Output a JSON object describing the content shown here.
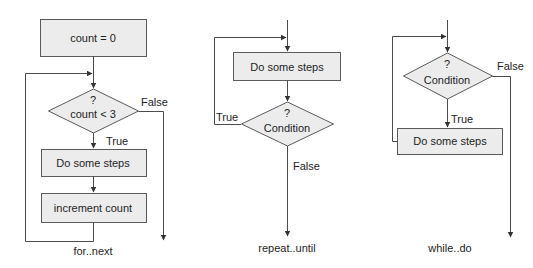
{
  "diagram": {
    "colors": {
      "shape_fill": "#ececec",
      "shape_stroke": "#5a5a5a",
      "line": "#4a4a4a",
      "text": "#1e1e1e"
    },
    "for_next": {
      "caption": "for..next",
      "init_box": "count = 0",
      "decision_mark": "?",
      "decision_text": "count < 3",
      "true_label": "True",
      "false_label": "False",
      "body_box": "Do some steps",
      "increment_box": "increment count"
    },
    "repeat_until": {
      "caption": "repeat..until",
      "body_box": "Do some steps",
      "decision_mark": "?",
      "decision_text": "Condition",
      "true_label": "True",
      "false_label": "False"
    },
    "while_do": {
      "caption": "while..do",
      "decision_mark": "?",
      "decision_text": "Condition",
      "true_label": "True",
      "false_label": "False",
      "body_box": "Do some steps"
    }
  }
}
